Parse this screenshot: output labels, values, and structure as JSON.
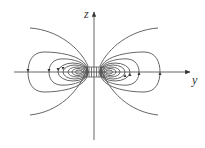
{
  "diagram": {
    "axes": {
      "vertical_label": "z",
      "horizontal_label": "y"
    },
    "colors": {
      "line": "#555555",
      "background": "#ffffff"
    },
    "field_lines": {
      "open_curves_per_side": 1,
      "closed_loops_per_side": 7,
      "symmetry": "mirror about z-axis and y-axis"
    }
  }
}
